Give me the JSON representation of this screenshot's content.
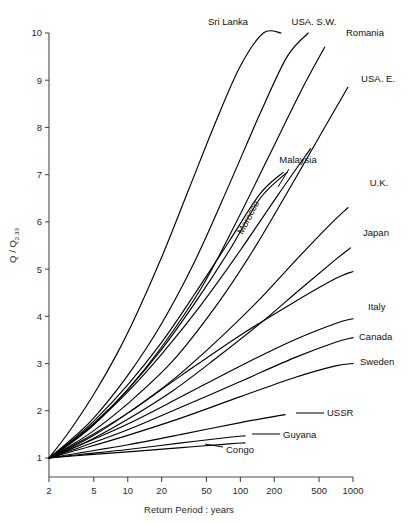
{
  "chart_data": {
    "type": "line",
    "title": "",
    "xlabel": "Return Period : years",
    "ylabel": "Q / Q",
    "ylabel_subscript": "2.33",
    "xscale": "log",
    "yscale": "linear",
    "xlim": [
      2,
      1000
    ],
    "ylim": [
      1,
      10
    ],
    "xticks": [
      2,
      5,
      10,
      20,
      50,
      100,
      200,
      500,
      1000
    ],
    "xtick_labels": [
      "2",
      "5",
      "10",
      "20",
      "50",
      "100",
      "200",
      "500",
      "1000"
    ],
    "yticks": [
      1,
      2,
      3,
      4,
      5,
      6,
      7,
      8,
      9,
      10
    ],
    "ytick_labels": [
      "1",
      "2",
      "3",
      "4",
      "5",
      "6",
      "7",
      "8",
      "9",
      "10"
    ],
    "grid": false,
    "legend": "inline-curve-labels",
    "origin_point": [
      2,
      1
    ],
    "note": "Regional flood frequency growth curves; all curves pass through Q/Q2.33 = 1 at a 2-year return period.",
    "series": [
      {
        "name": "Sri Lanka",
        "label_x": 228,
        "label_y": 25,
        "label_anchor": "middle",
        "leader": false,
        "x": [
          2,
          3,
          5,
          8,
          12,
          20,
          35,
          60,
          100,
          160,
          230
        ],
        "y": [
          1.0,
          1.55,
          2.35,
          3.2,
          4.05,
          5.25,
          6.7,
          8.1,
          9.3,
          10.0,
          10.0
        ]
      },
      {
        "name": "USA. S.W.",
        "label_x": 314,
        "label_y": 25,
        "label_anchor": "middle",
        "leader": false,
        "x": [
          2,
          3,
          5,
          10,
          20,
          40,
          80,
          150,
          260,
          400
        ],
        "y": [
          1.0,
          1.35,
          1.85,
          2.75,
          3.85,
          5.2,
          6.8,
          8.3,
          9.5,
          10.0
        ]
      },
      {
        "name": "Romania",
        "label_x": 365,
        "label_y": 36,
        "label_anchor": "middle",
        "leader": false,
        "x": [
          2,
          3,
          5,
          10,
          20,
          45,
          90,
          180,
          350,
          560
        ],
        "y": [
          1.0,
          1.28,
          1.7,
          2.45,
          3.35,
          4.6,
          5.95,
          7.4,
          8.8,
          9.7
        ]
      },
      {
        "name": "USA. E.",
        "label_x": 378,
        "label_y": 82,
        "label_anchor": "middle",
        "leader": false,
        "x": [
          2,
          3,
          5,
          10,
          25,
          60,
          130,
          280,
          560,
          900
        ],
        "y": [
          1.0,
          1.24,
          1.58,
          2.15,
          3.05,
          4.2,
          5.4,
          6.75,
          8.0,
          8.85
        ]
      },
      {
        "name": "Malaysia",
        "label_x": 298,
        "label_y": 163,
        "label_anchor": "middle",
        "leader": true,
        "leader_x1": 289,
        "leader_y1": 169,
        "leader_x2": 278,
        "leader_y2": 187,
        "x": [
          2,
          3,
          5,
          10,
          20,
          40,
          80,
          150,
          240
        ],
        "y": [
          1.0,
          1.32,
          1.78,
          2.55,
          3.45,
          4.5,
          5.6,
          6.6,
          7.05
        ]
      },
      {
        "name": "Morocco",
        "label_x": 251,
        "label_y": 219,
        "label_anchor": "middle",
        "leader": false,
        "rotate": -62,
        "x": [
          2,
          3,
          5,
          10,
          20,
          40,
          80,
          150,
          260
        ],
        "y": [
          1.0,
          1.3,
          1.73,
          2.45,
          3.3,
          4.3,
          5.4,
          6.5,
          7.05
        ]
      },
      {
        "name": "U.K.",
        "label_x": 379,
        "label_y": 186,
        "label_anchor": "middle",
        "leader": false,
        "x": [
          2,
          3,
          5,
          10,
          25,
          60,
          140,
          300,
          600,
          900
        ],
        "y": [
          1.0,
          1.2,
          1.48,
          1.95,
          2.65,
          3.45,
          4.3,
          5.15,
          5.9,
          6.3
        ]
      },
      {
        "name": "Japan",
        "label_x": 376,
        "label_y": 236,
        "label_anchor": "middle",
        "leader": false,
        "x": [
          2,
          3,
          5,
          10,
          25,
          60,
          150,
          350,
          700,
          950
        ],
        "y": [
          1.0,
          1.17,
          1.42,
          1.82,
          2.42,
          3.1,
          3.85,
          4.6,
          5.2,
          5.45
        ]
      },
      {
        "name": "Italy",
        "label_x": 368,
        "label_y": 310,
        "label_anchor": "start",
        "leader": false,
        "x": [
          2,
          4,
          10,
          30,
          100,
          300,
          700,
          1000
        ],
        "y": [
          1.0,
          1.3,
          1.72,
          2.3,
          2.95,
          3.5,
          3.85,
          3.95
        ]
      },
      {
        "name": "Canada",
        "label_x": 359,
        "label_y": 340,
        "label_anchor": "start",
        "leader": false,
        "x": [
          2,
          4,
          10,
          30,
          100,
          300,
          700,
          1000
        ],
        "y": [
          1.0,
          1.25,
          1.6,
          2.08,
          2.62,
          3.12,
          3.45,
          3.55
        ]
      },
      {
        "name": "Sweden",
        "label_x": 360,
        "label_y": 365,
        "label_anchor": "start",
        "leader": false,
        "x": [
          2,
          4,
          10,
          30,
          100,
          300,
          700,
          1000
        ],
        "y": [
          1.0,
          1.2,
          1.48,
          1.85,
          2.3,
          2.7,
          2.95,
          3.0
        ]
      },
      {
        "name": "USSR",
        "label_x": 327,
        "label_y": 416,
        "label_anchor": "start",
        "leader": true,
        "leader_x1": 324,
        "leader_y1": 413,
        "leader_x2": 296,
        "leader_y2": 413,
        "x": [
          2,
          4,
          10,
          30,
          100,
          250
        ],
        "y": [
          1.0,
          1.12,
          1.28,
          1.5,
          1.75,
          1.92
        ]
      },
      {
        "name": "Guyana",
        "label_x": 283,
        "label_y": 438,
        "label_anchor": "start",
        "leader": true,
        "leader_x1": 280,
        "leader_y1": 434,
        "leader_x2": 252,
        "leader_y2": 434,
        "x": [
          2,
          4,
          10,
          30,
          80,
          110
        ],
        "y": [
          1.0,
          1.08,
          1.18,
          1.32,
          1.44,
          1.47
        ]
      },
      {
        "name": "Congo",
        "label_x": 226,
        "label_y": 453,
        "label_anchor": "start",
        "leader": true,
        "leader_x1": 223,
        "leader_y1": 447,
        "leader_x2": 205,
        "leader_y2": 444,
        "x": [
          2,
          4,
          10,
          30,
          80,
          110
        ],
        "y": [
          1.0,
          1.06,
          1.13,
          1.22,
          1.3,
          1.32
        ]
      },
      {
        "name": "unlabelled-curve-a",
        "label_x": null,
        "label_y": null,
        "label_anchor": "middle",
        "leader": false,
        "x": [
          2,
          3,
          5,
          10,
          20,
          45,
          100,
          220,
          420
        ],
        "y": [
          1.0,
          1.3,
          1.72,
          2.4,
          3.2,
          4.25,
          5.4,
          6.6,
          7.55
        ]
      },
      {
        "name": "unlabelled-curve-b",
        "label_x": null,
        "label_y": null,
        "label_anchor": "middle",
        "leader": false,
        "x": [
          2,
          4,
          10,
          30,
          100,
          300,
          700,
          1000
        ],
        "y": [
          1.0,
          1.38,
          1.95,
          2.75,
          3.6,
          4.3,
          4.8,
          4.95
        ]
      }
    ]
  },
  "figure": {
    "background": "#ffffff",
    "ink_color": "#000000",
    "axis_color": "#4a4a4a"
  }
}
